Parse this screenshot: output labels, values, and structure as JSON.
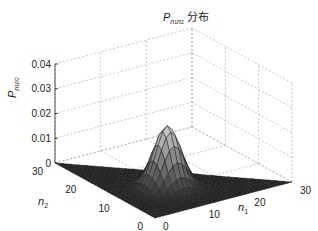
{
  "chart_data": {
    "type": "surface3d",
    "title_parts": {
      "symbol": "P",
      "sub1": "n",
      "sub1i": "1",
      "sub2": "n",
      "sub2i": "2",
      "suffix": "分布"
    },
    "xlabel": "n1",
    "ylabel": "n2",
    "zlabel": "P_{n1 n2}",
    "x_ticks": [
      "0",
      "10",
      "20",
      "30"
    ],
    "y_ticks": [
      "0",
      "10",
      "20",
      "30"
    ],
    "z_ticks": [
      "0",
      "0.01",
      "0.02",
      "0.03",
      "0.04"
    ],
    "xlim": [
      0,
      30
    ],
    "ylim": [
      0,
      30
    ],
    "zlim": [
      0,
      0.04
    ],
    "grid": true,
    "surface": {
      "shape": "2D Gaussian peak",
      "peak_n1": 10,
      "peak_n2": 10,
      "peak_value": 0.025,
      "sigma": 2.5,
      "domain": "triangular region n1 + n2 <= 30"
    }
  },
  "labels": {
    "title_symbol": "P",
    "title_suffix": "分布",
    "z_axis_symbol": "P",
    "x_axis_symbol": "n",
    "x_axis_sub": "1",
    "y_axis_symbol": "n",
    "y_axis_sub": "2",
    "n_sub": "n",
    "sub1": "1",
    "sub2": "2"
  }
}
